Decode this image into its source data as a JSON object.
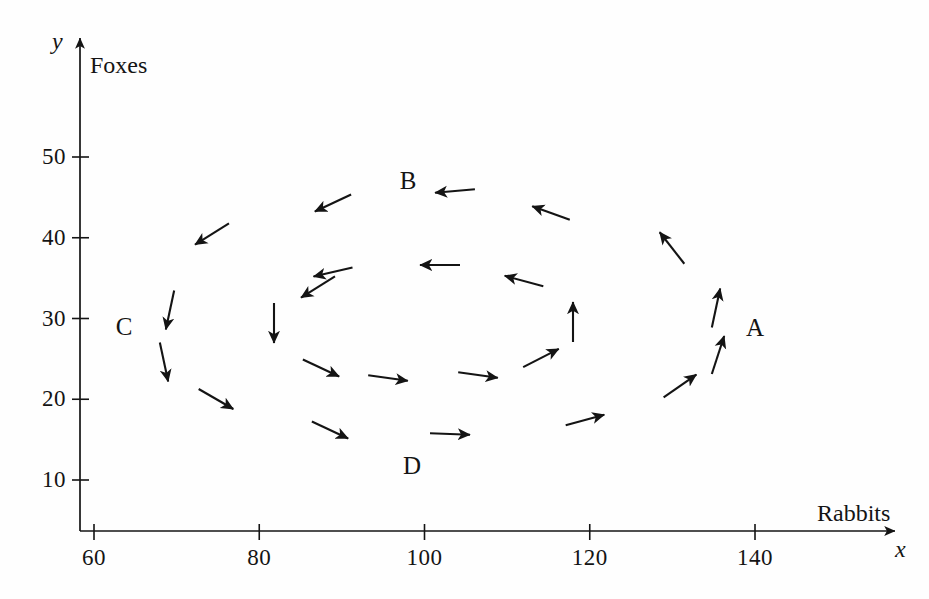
{
  "figure": {
    "title": "",
    "background_color": "#fefefe",
    "ink_color": "#141414"
  },
  "axes": {
    "x": {
      "variable": "x",
      "name": "Rabbits",
      "ticks": [
        "60",
        "80",
        "100",
        "120",
        "140"
      ],
      "tick_values": [
        60,
        80,
        100,
        120,
        140
      ],
      "range": [
        56,
        148
      ]
    },
    "y": {
      "variable": "y",
      "name": "Foxes",
      "ticks": [
        "50",
        "40",
        "30",
        "20",
        "10"
      ],
      "tick_values": [
        50,
        40,
        30,
        20,
        10
      ],
      "range": [
        5,
        58
      ]
    }
  },
  "region_labels": [
    {
      "text": "A",
      "x": 755,
      "y": 328
    },
    {
      "text": "B",
      "x": 408,
      "y": 181
    },
    {
      "text": "C",
      "x": 124,
      "y": 327
    },
    {
      "text": "D",
      "x": 412,
      "y": 466
    }
  ],
  "chart_data": {
    "type": "scatter",
    "xlabel": "Rabbits",
    "ylabel": "Foxes",
    "xlim": [
      56,
      148
    ],
    "ylim": [
      5,
      58
    ],
    "grid": false,
    "legend": null,
    "annotations": [
      {
        "label": "A",
        "data_x": 136,
        "data_y": 30
      },
      {
        "label": "B",
        "data_x": 98,
        "data_y": 48
      },
      {
        "label": "C",
        "data_x": 64,
        "data_y": 30
      },
      {
        "label": "D",
        "data_x": 98,
        "data_y": 13
      }
    ],
    "vectors": [
      {
        "ring": "outer",
        "x": 455,
        "y": 191,
        "angle": 185
      },
      {
        "ring": "outer",
        "x": 333,
        "y": 203,
        "angle": 205
      },
      {
        "ring": "outer",
        "x": 551,
        "y": 213,
        "angle": 160
      },
      {
        "ring": "outer",
        "x": 212,
        "y": 234,
        "angle": 212
      },
      {
        "ring": "outer",
        "x": 672,
        "y": 248,
        "angle": 128
      },
      {
        "ring": "outer",
        "x": 170,
        "y": 310,
        "angle": 258
      },
      {
        "ring": "outer",
        "x": 716,
        "y": 308,
        "angle": 78
      },
      {
        "ring": "outer",
        "x": 164,
        "y": 362,
        "angle": 282
      },
      {
        "ring": "outer",
        "x": 718,
        "y": 355,
        "angle": 72
      },
      {
        "ring": "outer",
        "x": 216,
        "y": 399,
        "angle": 330
      },
      {
        "ring": "outer",
        "x": 680,
        "y": 386,
        "angle": 35
      },
      {
        "ring": "outer",
        "x": 330,
        "y": 430,
        "angle": 335
      },
      {
        "ring": "outer",
        "x": 450,
        "y": 434,
        "angle": 358
      },
      {
        "ring": "outer",
        "x": 585,
        "y": 420,
        "angle": 15
      },
      {
        "ring": "inner",
        "x": 333,
        "y": 272,
        "angle": 193
      },
      {
        "ring": "inner",
        "x": 440,
        "y": 265,
        "angle": 180
      },
      {
        "ring": "inner",
        "x": 524,
        "y": 281,
        "angle": 165
      },
      {
        "ring": "inner",
        "x": 318,
        "y": 287,
        "angle": 212
      },
      {
        "ring": "inner",
        "x": 573,
        "y": 322,
        "angle": 90
      },
      {
        "ring": "inner",
        "x": 274,
        "y": 323,
        "angle": 270
      },
      {
        "ring": "inner",
        "x": 321,
        "y": 368,
        "angle": 335
      },
      {
        "ring": "inner",
        "x": 388,
        "y": 378,
        "angle": 352
      },
      {
        "ring": "inner",
        "x": 478,
        "y": 375,
        "angle": 352
      },
      {
        "ring": "inner",
        "x": 541,
        "y": 358,
        "angle": 27
      }
    ]
  }
}
